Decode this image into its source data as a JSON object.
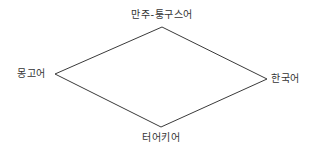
{
  "diagram": {
    "type": "diamond-relationship",
    "line_color": "#3a3a3a",
    "text_color": "#333333",
    "nodes": {
      "top": {
        "label": "만주-퉁구스어"
      },
      "left": {
        "label": "몽고어"
      },
      "right": {
        "label": "한국어"
      },
      "bottom": {
        "label": "터어키어"
      }
    },
    "edges": [
      {
        "from": "top",
        "to": "left"
      },
      {
        "from": "top",
        "to": "right"
      },
      {
        "from": "left",
        "to": "bottom"
      },
      {
        "from": "right",
        "to": "bottom"
      }
    ]
  }
}
